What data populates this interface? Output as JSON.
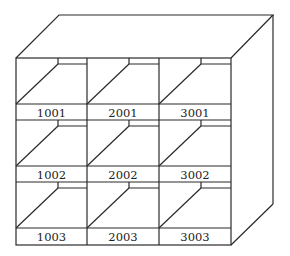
{
  "diagram": {
    "type": "shelving-unit",
    "grid": {
      "rows": 3,
      "columns": 3
    },
    "labels": [
      [
        "1001",
        "2001",
        "3001"
      ],
      [
        "1002",
        "2002",
        "3002"
      ],
      [
        "1003",
        "2003",
        "3003"
      ]
    ],
    "colors": {
      "line": "#2a2a2a",
      "background": "#ffffff"
    }
  }
}
